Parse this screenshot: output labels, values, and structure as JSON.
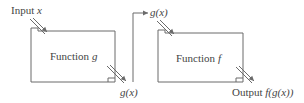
{
  "diagram": {
    "input_label": {
      "text": "Input ",
      "var": "x"
    },
    "function_g": {
      "text": "Function ",
      "var": "g"
    },
    "g_output_label": "g(x)",
    "g_input_label": "g(x)",
    "function_f": {
      "text": "Function ",
      "var": "f"
    },
    "output_label": {
      "text": "Output ",
      "expr": "f(g(x))"
    }
  },
  "colors": {
    "stroke": "#6b6b6b",
    "text": "#444444",
    "background": "#ffffff"
  }
}
